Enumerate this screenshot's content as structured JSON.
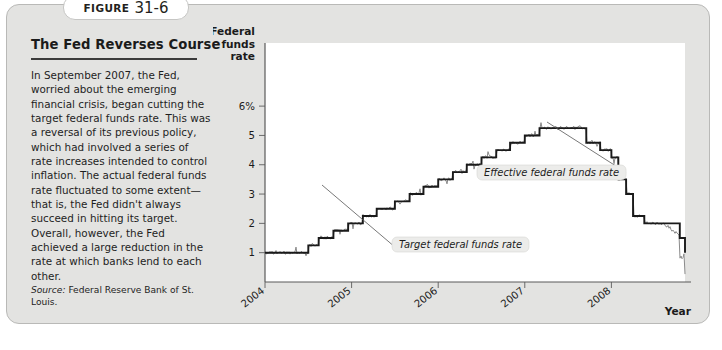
{
  "figure": {
    "label_word": "FIGURE",
    "number": "31-6"
  },
  "panel": {
    "title": "The Fed Reverses Course",
    "body": "In September 2007, the Fed, worried about the emerging financial crisis, began cutting the target federal funds rate. This was a reversal of its previous policy, which had involved a series of rate increases intended to control inflation. The actual federal funds rate fluctuated to some extent—that is, the Fed didn't always succeed in hitting its target. Overall, however, the Fed achieved a large reduction in the rate at which banks lend to each other.",
    "source_label": "Source:",
    "source_text": " Federal Reserve Bank of St. Louis."
  },
  "chart_data": {
    "type": "line",
    "title": "",
    "ylabel": "Federal funds rate",
    "ylabel_lines": [
      "Federal",
      "funds",
      "rate"
    ],
    "xlabel": "Year",
    "ytick_labels": [
      "6%",
      "5",
      "4",
      "3",
      "2",
      "1"
    ],
    "ytick_values": [
      6,
      5,
      4,
      3,
      2,
      1
    ],
    "ylim": [
      0,
      6.55
    ],
    "xlim": [
      2004.0,
      2008.85
    ],
    "xtick_labels": [
      "2004",
      "2005",
      "2006",
      "2007",
      "2008"
    ],
    "xtick_values": [
      2004,
      2005,
      2006,
      2007,
      2008
    ],
    "grid": false,
    "legend_position": "annotations",
    "annotations": [
      {
        "name": "effective-federal-funds-rate",
        "text": "Effective federal funds rate",
        "box_x": 470,
        "box_y": 160,
        "leader_to_x": 540,
        "leader_to_y": 117
      },
      {
        "name": "target-federal-funds-rate",
        "text": "Target federal funds rate",
        "box_x": 385,
        "box_y": 232,
        "leader_to_x": 315,
        "leader_to_y": 180
      }
    ],
    "series": [
      {
        "name": "Target federal funds rate",
        "style": "step",
        "color": "#1a1a1a",
        "width": 1.9,
        "points": [
          [
            2004.0,
            1.0
          ],
          [
            2004.5,
            1.0
          ],
          [
            2004.5,
            1.25
          ],
          [
            2004.62,
            1.25
          ],
          [
            2004.62,
            1.5
          ],
          [
            2004.71,
            1.5
          ],
          [
            2004.79,
            1.75
          ],
          [
            2004.88,
            1.75
          ],
          [
            2004.96,
            2.0
          ],
          [
            2005.04,
            2.0
          ],
          [
            2005.13,
            2.25
          ],
          [
            2005.21,
            2.25
          ],
          [
            2005.29,
            2.5
          ],
          [
            2005.38,
            2.5
          ],
          [
            2005.5,
            2.75
          ],
          [
            2005.58,
            2.75
          ],
          [
            2005.67,
            3.0
          ],
          [
            2005.75,
            3.0
          ],
          [
            2005.83,
            3.25
          ],
          [
            2005.92,
            3.25
          ],
          [
            2006.0,
            3.5
          ],
          [
            2006.08,
            3.5
          ],
          [
            2006.17,
            3.75
          ],
          [
            2006.25,
            3.75
          ],
          [
            2006.33,
            4.0
          ],
          [
            2006.42,
            4.0
          ],
          [
            2006.5,
            4.25
          ],
          [
            2006.58,
            4.25
          ],
          [
            2006.67,
            4.5
          ],
          [
            2006.75,
            4.5
          ],
          [
            2006.83,
            4.75
          ],
          [
            2006.92,
            4.75
          ],
          [
            2007.0,
            5.0
          ],
          [
            2007.08,
            5.0
          ],
          [
            2007.17,
            5.25
          ],
          [
            2007.7,
            5.25
          ],
          [
            2007.71,
            4.75
          ],
          [
            2007.79,
            4.75
          ],
          [
            2007.87,
            4.5
          ],
          [
            2007.96,
            4.5
          ],
          [
            2008.0,
            4.25
          ],
          [
            2008.04,
            4.25
          ],
          [
            2008.08,
            3.5
          ],
          [
            2008.13,
            3.5
          ],
          [
            2008.17,
            3.0
          ],
          [
            2008.21,
            3.0
          ],
          [
            2008.25,
            2.25
          ],
          [
            2008.33,
            2.25
          ],
          [
            2008.38,
            2.0
          ],
          [
            2008.75,
            2.0
          ],
          [
            2008.79,
            1.5
          ],
          [
            2008.83,
            1.5
          ],
          [
            2008.85,
            1.0
          ],
          [
            2008.85,
            1.0
          ]
        ]
      },
      {
        "name": "Effective federal funds rate",
        "style": "noisy",
        "color": "#8a8a8a",
        "width": 1.0,
        "noise": 0.11,
        "end_drop": 0.22
      }
    ]
  }
}
